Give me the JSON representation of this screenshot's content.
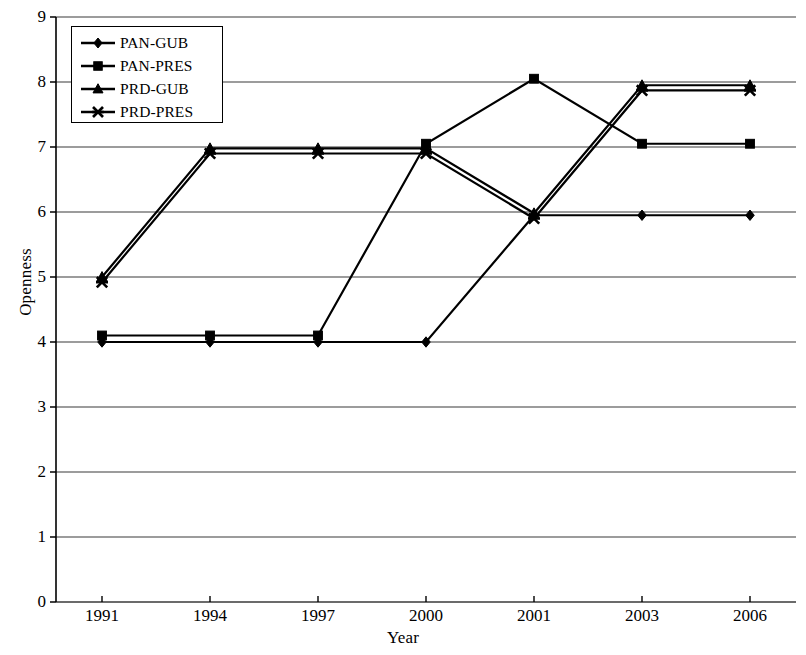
{
  "chart_data": {
    "type": "line",
    "title": "",
    "xlabel": "Year",
    "ylabel": "Openness",
    "categories": [
      "1991",
      "1994",
      "1997",
      "2000",
      "2001",
      "2003",
      "2006"
    ],
    "ylim": [
      0,
      9
    ],
    "yticks": [
      0,
      1,
      2,
      3,
      4,
      5,
      6,
      7,
      8,
      9
    ],
    "ytick_labels": [
      "0",
      "1",
      "2",
      "3",
      "4",
      "5",
      "6",
      "7",
      "8",
      "9"
    ],
    "grid": true,
    "grid_axis": "y",
    "legend_position": "upper left",
    "line_color": "#000000",
    "background": "#ffffff",
    "series": [
      {
        "name": "PAN-GUB",
        "marker": "diamond",
        "values": [
          4.0,
          4.0,
          4.0,
          4.0,
          5.95,
          5.95,
          5.95
        ]
      },
      {
        "name": "PAN-PRES",
        "marker": "square",
        "values": [
          4.1,
          4.1,
          4.1,
          7.05,
          8.05,
          7.05,
          7.05
        ]
      },
      {
        "name": "PRD-GUB",
        "marker": "triangle",
        "values": [
          5.0,
          6.98,
          6.98,
          6.98,
          5.98,
          7.95,
          7.95
        ]
      },
      {
        "name": "PRD-PRES",
        "marker": "x",
        "values": [
          4.92,
          6.9,
          6.9,
          6.9,
          5.9,
          7.87,
          7.87
        ]
      }
    ]
  },
  "legend": {
    "items": [
      {
        "label": "PAN-GUB",
        "marker": "diamond"
      },
      {
        "label": "PAN-PRES",
        "marker": "square"
      },
      {
        "label": "PRD-GUB",
        "marker": "triangle"
      },
      {
        "label": "PRD-PRES",
        "marker": "x"
      }
    ]
  },
  "axes": {
    "y_title": "Openness",
    "x_title": "Year",
    "y_labels": [
      "9",
      "8",
      "7",
      "6",
      "5",
      "4",
      "3",
      "2",
      "1",
      "0"
    ],
    "x_labels": [
      "1991",
      "1994",
      "1997",
      "2000",
      "2001",
      "2003",
      "2006"
    ]
  }
}
